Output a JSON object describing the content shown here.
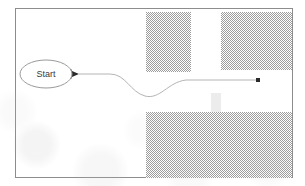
{
  "figure": {
    "kind": "flow-diagram",
    "background_color": "#ffffff",
    "frame": {
      "name": "diagram-frame",
      "x": 15,
      "y": 8,
      "width": 278,
      "height": 170,
      "stroke_color": "#8d8d8d",
      "stroke_width": 1,
      "fill": "#ffffff"
    },
    "nodes": [
      {
        "id": "start",
        "shape": "ellipse",
        "label": "Start",
        "cx": 46,
        "cy": 74,
        "rx": 26,
        "ry": 14,
        "stroke_color": "#9a9a9a",
        "fill": "#ffffff",
        "label_color": "#3a3a3a",
        "font_size": 9
      }
    ],
    "edges": [
      {
        "id": "start-to-end",
        "from": "start",
        "to": "end-point",
        "stroke_color": "#b4b4b4",
        "stroke_width": 1,
        "path": "M 79 74 L 110 74 C 126 74 130 92 145 96 C 160 100 168 82 186 80 L 258 80",
        "start_marker": "arrow-head",
        "end_marker": "square-dot",
        "marker_color": "#2b2b2b"
      }
    ],
    "hatched_blocks": [
      {
        "id": "block-top-left",
        "name": "hatched-block-top-left",
        "x": 146,
        "y": 12,
        "width": 45,
        "height": 60,
        "pattern": "checker-dither",
        "pattern_color": "#9c9c9c",
        "pattern_background": "#ffffff"
      },
      {
        "id": "block-top-right",
        "name": "hatched-block-top-right",
        "x": 221,
        "y": 12,
        "width": 71,
        "height": 58,
        "pattern": "checker-dither",
        "pattern_color": "#9c9c9c",
        "pattern_background": "#ffffff"
      },
      {
        "id": "block-bottom",
        "name": "hatched-block-bottom",
        "x": 146,
        "y": 112,
        "width": 146,
        "height": 66,
        "pattern": "checker-dither",
        "pattern_color": "#9c9c9c",
        "pattern_background": "#ffffff"
      }
    ],
    "faint_blocks": [
      {
        "id": "faint-tab",
        "name": "faint-tab-block",
        "x": 211,
        "y": 93,
        "width": 10,
        "height": 19,
        "fill": "#ececec"
      }
    ]
  }
}
